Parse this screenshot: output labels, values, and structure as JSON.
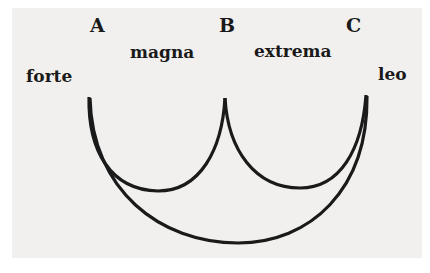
{
  "diagram": {
    "labels": {
      "A": "A",
      "B": "B",
      "C": "C",
      "left": "forte",
      "arc_ab": "magna",
      "arc_bc": "extrema",
      "right": "leo"
    },
    "colors": {
      "paper": "#f1f0ee",
      "ink": "#1a1a1a"
    }
  }
}
